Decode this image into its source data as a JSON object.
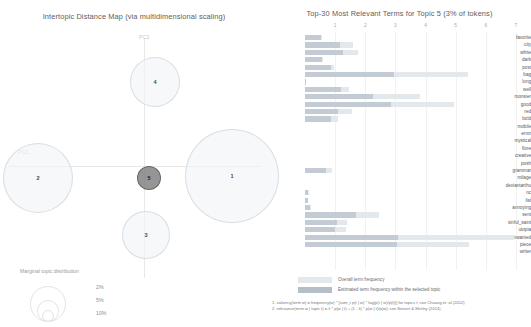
{
  "left_panel": {
    "title": "Intertopic Distance Map (via multidimensional scaling)",
    "axis_labels": {
      "x": "PC1",
      "y": "PC2"
    },
    "topics": [
      {
        "id": "1",
        "label": "1",
        "x": 232,
        "y": 176,
        "r": 47,
        "selected": false
      },
      {
        "id": "2",
        "label": "2",
        "x": 38,
        "y": 178,
        "r": 35,
        "selected": false
      },
      {
        "id": "3",
        "label": "3",
        "x": 146,
        "y": 235,
        "r": 24,
        "selected": false
      },
      {
        "id": "4",
        "label": "4",
        "x": 155,
        "y": 82,
        "r": 25,
        "selected": false
      },
      {
        "id": "5",
        "label": "5",
        "x": 149,
        "y": 178,
        "r": 12,
        "selected": true
      }
    ],
    "marginal_legend": {
      "title": "Marginal topic distribution",
      "items": [
        {
          "pct": "2%",
          "r": 6
        },
        {
          "pct": "5%",
          "r": 11
        },
        {
          "pct": "10%",
          "r": 18
        }
      ]
    }
  },
  "right_panel": {
    "title": "Top-30 Most Relevant Terms for Topic 5 (3% of tokens)",
    "legend": {
      "overall": "Overall term frequency",
      "estimated": "Estimated term frequency within the selected topic"
    },
    "footnotes": [
      "1. saliency(term w) = frequency(w) * [sum_t p(t | w) * log(p(t | w)/p(t))] for topics t; see Chuang et. al (2012)",
      "2. relevance(term w | topic t) = λ * p(w | t) + (1 - λ) * p(w | t)/p(w); see Sievert & Shirley (2014)"
    ]
  },
  "chart_data": {
    "type": "bar",
    "title": "Top-30 Most Relevant Terms for Topic 5 (3% of tokens)",
    "xlabel": "",
    "ylabel": "",
    "xlim": [
      0,
      7.5
    ],
    "xticks": [
      1,
      2,
      3,
      4,
      5,
      6,
      7
    ],
    "grid": true,
    "legend_position": "bottom",
    "orientation": "horizontal",
    "categories": [
      "favorite",
      "city",
      "white",
      "dark",
      "post",
      "bag",
      "long",
      "well",
      "monster",
      "good",
      "red",
      "bold",
      "mobile",
      "error",
      "mystical",
      "flore",
      "creative",
      "posh",
      "grammar",
      "milage",
      "deviantarthu",
      "nc",
      "list",
      "annoying",
      "sent",
      "sinful_saint",
      "utopia",
      "unwanted",
      "piece",
      "writer"
    ],
    "series": [
      {
        "name": "Overall term frequency",
        "values": [
          0.55,
          1.6,
          1.75,
          0.6,
          0.95,
          5.4,
          0.04,
          1.45,
          3.8,
          4.95,
          1.55,
          1.1,
          0.0,
          0.0,
          0.0,
          0.0,
          0.0,
          0.0,
          0.9,
          0.0,
          0.0,
          0.12,
          0.1,
          0.2,
          2.45,
          1.4,
          1.35,
          6.95,
          5.45,
          0.0
        ]
      },
      {
        "name": "Estimated term frequency within the selected topic",
        "values": [
          0.52,
          1.15,
          1.25,
          0.55,
          0.85,
          2.95,
          0.04,
          1.2,
          2.25,
          2.85,
          1.1,
          0.85,
          0.0,
          0.0,
          0.0,
          0.0,
          0.0,
          0.0,
          0.7,
          0.0,
          0.0,
          0.1,
          0.09,
          0.18,
          1.7,
          1.05,
          1.0,
          3.1,
          3.05,
          0.0
        ]
      }
    ]
  }
}
